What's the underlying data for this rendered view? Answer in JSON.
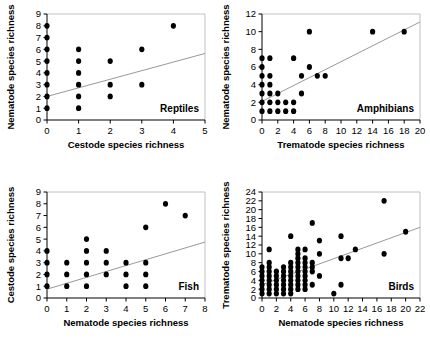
{
  "figure": {
    "panel_count": 4,
    "marker_color": "#000000",
    "trend_color": "#8c8c8c",
    "axis_color": "#000000",
    "frame_color": "#b9b9b9",
    "background": "#ffffff"
  },
  "chart_data": [
    {
      "type": "scatter",
      "id": "reptiles",
      "title": "",
      "annotation": "Reptiles",
      "xlabel": "Cestode species richness",
      "ylabel": "Nematode species richness",
      "xlim": [
        0,
        5
      ],
      "ylim": [
        0,
        9
      ],
      "xticks": [
        0,
        1,
        2,
        3,
        4,
        5
      ],
      "yticks": [
        0,
        1,
        2,
        3,
        4,
        5,
        6,
        7,
        8,
        9
      ],
      "grid": false,
      "legend": "none",
      "trendline": {
        "x0": 0,
        "y0": 2.0,
        "x1": 5,
        "y1": 5.65
      },
      "points": [
        {
          "x": 0,
          "y": 1
        },
        {
          "x": 0,
          "y": 2
        },
        {
          "x": 0,
          "y": 3
        },
        {
          "x": 0,
          "y": 4
        },
        {
          "x": 0,
          "y": 5
        },
        {
          "x": 0,
          "y": 6
        },
        {
          "x": 0,
          "y": 7
        },
        {
          "x": 0,
          "y": 8
        },
        {
          "x": 1,
          "y": 1
        },
        {
          "x": 1,
          "y": 2
        },
        {
          "x": 1,
          "y": 3
        },
        {
          "x": 1,
          "y": 4
        },
        {
          "x": 1,
          "y": 5
        },
        {
          "x": 1,
          "y": 6
        },
        {
          "x": 2,
          "y": 2
        },
        {
          "x": 2,
          "y": 3
        },
        {
          "x": 2,
          "y": 5
        },
        {
          "x": 3,
          "y": 3
        },
        {
          "x": 3,
          "y": 6
        },
        {
          "x": 4,
          "y": 8
        }
      ]
    },
    {
      "type": "scatter",
      "id": "amphibians",
      "title": "",
      "annotation": "Amphibians",
      "xlabel": "Trematode species richness",
      "ylabel": "Nematode species richness",
      "xlim": [
        0,
        20
      ],
      "ylim": [
        0,
        12
      ],
      "xticks": [
        0,
        2,
        4,
        6,
        8,
        10,
        12,
        14,
        16,
        18,
        20
      ],
      "yticks": [
        0,
        2,
        4,
        6,
        8,
        10,
        12
      ],
      "grid": false,
      "legend": "none",
      "trendline": {
        "x0": 0,
        "y0": 2.1,
        "x1": 20,
        "y1": 11.1
      },
      "points": [
        {
          "x": 0,
          "y": 1
        },
        {
          "x": 0,
          "y": 2
        },
        {
          "x": 0,
          "y": 3
        },
        {
          "x": 0,
          "y": 4
        },
        {
          "x": 0,
          "y": 5
        },
        {
          "x": 0,
          "y": 6
        },
        {
          "x": 0,
          "y": 7
        },
        {
          "x": 1,
          "y": 1
        },
        {
          "x": 1,
          "y": 2
        },
        {
          "x": 1,
          "y": 3
        },
        {
          "x": 1,
          "y": 4
        },
        {
          "x": 1,
          "y": 5
        },
        {
          "x": 1,
          "y": 7
        },
        {
          "x": 2,
          "y": 1
        },
        {
          "x": 2,
          "y": 2
        },
        {
          "x": 2,
          "y": 3
        },
        {
          "x": 3,
          "y": 1
        },
        {
          "x": 3,
          "y": 2
        },
        {
          "x": 4,
          "y": 1
        },
        {
          "x": 4,
          "y": 2
        },
        {
          "x": 4,
          "y": 7
        },
        {
          "x": 5,
          "y": 3
        },
        {
          "x": 5,
          "y": 5
        },
        {
          "x": 6,
          "y": 6
        },
        {
          "x": 6,
          "y": 10
        },
        {
          "x": 7,
          "y": 5
        },
        {
          "x": 8,
          "y": 5
        },
        {
          "x": 14,
          "y": 10
        },
        {
          "x": 18,
          "y": 10
        }
      ]
    },
    {
      "type": "scatter",
      "id": "fish",
      "title": "",
      "annotation": "Fish",
      "xlabel": "Nematode species richness",
      "ylabel": "Cestode species richness",
      "xlim": [
        0,
        8
      ],
      "ylim": [
        0,
        9
      ],
      "xticks": [
        0,
        1,
        2,
        3,
        4,
        5,
        6,
        7,
        8
      ],
      "yticks": [
        0,
        1,
        2,
        3,
        4,
        5,
        6,
        7,
        8,
        9
      ],
      "grid": false,
      "legend": "none",
      "trendline": {
        "x0": 0,
        "y0": 0.75,
        "x1": 8,
        "y1": 4.75
      },
      "points": [
        {
          "x": 0,
          "y": 1
        },
        {
          "x": 0,
          "y": 2
        },
        {
          "x": 0,
          "y": 3
        },
        {
          "x": 0,
          "y": 4
        },
        {
          "x": 1,
          "y": 1
        },
        {
          "x": 1,
          "y": 2
        },
        {
          "x": 1,
          "y": 3
        },
        {
          "x": 2,
          "y": 1
        },
        {
          "x": 2,
          "y": 2
        },
        {
          "x": 2,
          "y": 3
        },
        {
          "x": 2,
          "y": 4
        },
        {
          "x": 2,
          "y": 5
        },
        {
          "x": 3,
          "y": 2
        },
        {
          "x": 3,
          "y": 3
        },
        {
          "x": 3,
          "y": 4
        },
        {
          "x": 4,
          "y": 1
        },
        {
          "x": 4,
          "y": 2
        },
        {
          "x": 4,
          "y": 3
        },
        {
          "x": 5,
          "y": 1
        },
        {
          "x": 5,
          "y": 2
        },
        {
          "x": 5,
          "y": 3
        },
        {
          "x": 5,
          "y": 6
        },
        {
          "x": 6,
          "y": 8
        },
        {
          "x": 7,
          "y": 7
        }
      ]
    },
    {
      "type": "scatter",
      "id": "birds",
      "title": "",
      "annotation": "Birds",
      "xlabel": "Nematode species richness",
      "ylabel": "Trematode species richness",
      "xlim": [
        0,
        22
      ],
      "ylim": [
        0,
        24
      ],
      "xticks": [
        0,
        2,
        4,
        6,
        8,
        10,
        12,
        14,
        16,
        18,
        20,
        22
      ],
      "yticks": [
        0,
        2,
        4,
        6,
        8,
        10,
        12,
        14,
        16,
        18,
        20,
        22,
        24
      ],
      "grid": false,
      "legend": "none",
      "trendline": {
        "x0": 0,
        "y0": 3.0,
        "x1": 22,
        "y1": 16.0
      },
      "points": [
        {
          "x": 0,
          "y": 1
        },
        {
          "x": 0,
          "y": 2
        },
        {
          "x": 0,
          "y": 3
        },
        {
          "x": 0,
          "y": 4
        },
        {
          "x": 0,
          "y": 5
        },
        {
          "x": 0,
          "y": 6
        },
        {
          "x": 0,
          "y": 7
        },
        {
          "x": 1,
          "y": 1
        },
        {
          "x": 1,
          "y": 2
        },
        {
          "x": 1,
          "y": 3
        },
        {
          "x": 1,
          "y": 4
        },
        {
          "x": 1,
          "y": 5
        },
        {
          "x": 1,
          "y": 6
        },
        {
          "x": 1,
          "y": 7
        },
        {
          "x": 1,
          "y": 8
        },
        {
          "x": 1,
          "y": 11
        },
        {
          "x": 2,
          "y": 1
        },
        {
          "x": 2,
          "y": 2
        },
        {
          "x": 2,
          "y": 3
        },
        {
          "x": 2,
          "y": 4
        },
        {
          "x": 2,
          "y": 5
        },
        {
          "x": 2,
          "y": 6
        },
        {
          "x": 3,
          "y": 1
        },
        {
          "x": 3,
          "y": 2
        },
        {
          "x": 3,
          "y": 3
        },
        {
          "x": 3,
          "y": 4
        },
        {
          "x": 3,
          "y": 5
        },
        {
          "x": 3,
          "y": 6
        },
        {
          "x": 3,
          "y": 7
        },
        {
          "x": 4,
          "y": 1
        },
        {
          "x": 4,
          "y": 2
        },
        {
          "x": 4,
          "y": 3
        },
        {
          "x": 4,
          "y": 4
        },
        {
          "x": 4,
          "y": 5
        },
        {
          "x": 4,
          "y": 6
        },
        {
          "x": 4,
          "y": 7
        },
        {
          "x": 4,
          "y": 8
        },
        {
          "x": 4,
          "y": 14
        },
        {
          "x": 5,
          "y": 2
        },
        {
          "x": 5,
          "y": 3
        },
        {
          "x": 5,
          "y": 4
        },
        {
          "x": 5,
          "y": 5
        },
        {
          "x": 5,
          "y": 6
        },
        {
          "x": 5,
          "y": 7
        },
        {
          "x": 5,
          "y": 8
        },
        {
          "x": 5,
          "y": 9
        },
        {
          "x": 5,
          "y": 10
        },
        {
          "x": 5,
          "y": 11
        },
        {
          "x": 6,
          "y": 2
        },
        {
          "x": 6,
          "y": 3
        },
        {
          "x": 6,
          "y": 4
        },
        {
          "x": 6,
          "y": 5
        },
        {
          "x": 6,
          "y": 6
        },
        {
          "x": 6,
          "y": 7
        },
        {
          "x": 6,
          "y": 8
        },
        {
          "x": 6,
          "y": 9
        },
        {
          "x": 6,
          "y": 11
        },
        {
          "x": 7,
          "y": 3
        },
        {
          "x": 7,
          "y": 6
        },
        {
          "x": 7,
          "y": 7
        },
        {
          "x": 7,
          "y": 8
        },
        {
          "x": 7,
          "y": 17
        },
        {
          "x": 8,
          "y": 5
        },
        {
          "x": 8,
          "y": 10
        },
        {
          "x": 8,
          "y": 13
        },
        {
          "x": 10,
          "y": 1
        },
        {
          "x": 11,
          "y": 3
        },
        {
          "x": 11,
          "y": 9
        },
        {
          "x": 11,
          "y": 14
        },
        {
          "x": 12,
          "y": 9
        },
        {
          "x": 13,
          "y": 11
        },
        {
          "x": 17,
          "y": 10
        },
        {
          "x": 17,
          "y": 22
        },
        {
          "x": 20,
          "y": 15
        }
      ]
    }
  ]
}
